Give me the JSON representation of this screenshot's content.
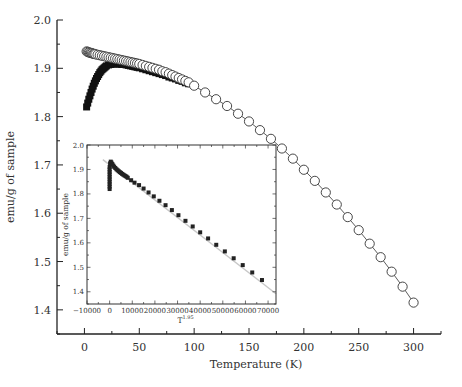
{
  "chart_data": [
    {
      "id": "main",
      "type": "scatter",
      "title": "",
      "xlabel": "Temperature (K)",
      "ylabel": "emu/g of sample",
      "xlim": [
        -25,
        325
      ],
      "ylim": [
        1.35,
        2.0
      ],
      "xticks": [
        0,
        50,
        100,
        150,
        200,
        250,
        300
      ],
      "yticks": [
        1.4,
        1.5,
        1.6,
        1.7,
        1.8,
        1.9,
        2.0
      ],
      "ytick_labels": [
        "1.4",
        "1.5",
        "1.6",
        "1.7",
        "1.8",
        "1.9",
        "2.0"
      ],
      "grid": false,
      "legend": null,
      "series": [
        {
          "name": "open-circles (FC)",
          "marker": "open-circle",
          "line": true,
          "x": [
            2,
            3,
            4,
            5,
            6,
            7,
            8,
            9,
            10,
            12,
            14,
            16,
            18,
            20,
            22,
            24,
            26,
            28,
            30,
            32,
            34,
            36,
            38,
            40,
            42,
            44,
            46,
            48,
            50,
            53,
            56,
            59,
            62,
            65,
            68,
            71,
            74,
            77,
            80,
            83,
            86,
            89,
            92,
            95,
            100,
            110,
            120,
            130,
            140,
            150,
            160,
            170,
            180,
            190,
            200,
            210,
            220,
            230,
            240,
            250,
            260,
            270,
            280,
            290,
            300
          ],
          "y": [
            1.935,
            1.934,
            1.933,
            1.932,
            1.932,
            1.931,
            1.93,
            1.93,
            1.929,
            1.928,
            1.927,
            1.926,
            1.925,
            1.924,
            1.923,
            1.922,
            1.921,
            1.92,
            1.919,
            1.918,
            1.917,
            1.916,
            1.915,
            1.914,
            1.913,
            1.912,
            1.911,
            1.91,
            1.909,
            1.907,
            1.905,
            1.903,
            1.901,
            1.899,
            1.897,
            1.894,
            1.892,
            1.889,
            1.886,
            1.883,
            1.88,
            1.877,
            1.874,
            1.871,
            1.864,
            1.85,
            1.836,
            1.822,
            1.806,
            1.79,
            1.772,
            1.754,
            1.734,
            1.713,
            1.69,
            1.667,
            1.643,
            1.618,
            1.592,
            1.565,
            1.537,
            1.509,
            1.479,
            1.448,
            1.415
          ]
        },
        {
          "name": "filled-squares (ZFC)",
          "marker": "filled-square",
          "line": false,
          "x": [
            2,
            3,
            4,
            5,
            6,
            7,
            8,
            9,
            10,
            11,
            12,
            13,
            14,
            15,
            16,
            17,
            18,
            19,
            20,
            22,
            24,
            26,
            28,
            30,
            32,
            34,
            36,
            38,
            40,
            42,
            44,
            46,
            48,
            50,
            53,
            56,
            59,
            62,
            65,
            68,
            71,
            74,
            77,
            80,
            83,
            86,
            89,
            92,
            95
          ],
          "y": [
            1.82,
            1.828,
            1.836,
            1.843,
            1.85,
            1.857,
            1.863,
            1.869,
            1.874,
            1.879,
            1.883,
            1.887,
            1.891,
            1.894,
            1.897,
            1.899,
            1.901,
            1.903,
            1.905,
            1.907,
            1.908,
            1.909,
            1.909,
            1.909,
            1.909,
            1.908,
            1.908,
            1.907,
            1.906,
            1.905,
            1.904,
            1.903,
            1.902,
            1.901,
            1.899,
            1.897,
            1.895,
            1.893,
            1.891,
            1.889,
            1.887,
            1.885,
            1.882,
            1.88,
            1.878,
            1.875,
            1.873,
            1.87,
            1.868
          ]
        }
      ]
    },
    {
      "id": "inset",
      "type": "scatter",
      "title": "",
      "xlabel": "T^1.95",
      "xlabel_base": "T",
      "xlabel_exp": "1.95",
      "ylabel": "emu/g of sample",
      "xlim": [
        -10000,
        73500
      ],
      "ylim": [
        1.35,
        2.0
      ],
      "xticks": [
        -10000,
        0,
        10000,
        20000,
        30000,
        40000,
        50000,
        60000,
        70000
      ],
      "xtick_labels": [
        "−10000",
        "0",
        "10000",
        "20000",
        "30000",
        "40000",
        "50000",
        "60000",
        "70000"
      ],
      "yticks": [
        1.4,
        1.5,
        1.6,
        1.7,
        1.8,
        1.9,
        2.0
      ],
      "ytick_labels": [
        "1.4",
        "1.5",
        "1.6",
        "1.7",
        "1.8",
        "1.9",
        "2.0"
      ],
      "grid": false,
      "legend": null,
      "fit_line": {
        "x": [
          -3000,
          73500
        ],
        "y": [
          1.94,
          1.392
        ],
        "color": "#c8c8c8"
      },
      "series": [
        {
          "name": "filled-squares",
          "marker": "filled-square",
          "x": [
            0,
            0,
            0,
            0,
            0,
            0,
            0,
            0,
            0,
            0,
            200,
            500,
            800,
            1200,
            1600,
            2000,
            2500,
            3000,
            3500,
            4000,
            4500,
            5000,
            5500,
            6000,
            6500,
            7000,
            7500,
            8000,
            9500,
            11000,
            13000,
            15000,
            17200,
            19500,
            22000,
            24700,
            27500,
            30400,
            33500,
            36700,
            40000,
            43500,
            47100,
            50900,
            54800,
            58800,
            63000,
            67300
          ],
          "y": [
            1.82,
            1.83,
            1.84,
            1.85,
            1.86,
            1.87,
            1.88,
            1.89,
            1.9,
            1.91,
            1.925,
            1.932,
            1.928,
            1.922,
            1.916,
            1.911,
            1.906,
            1.901,
            1.897,
            1.893,
            1.889,
            1.886,
            1.882,
            1.879,
            1.876,
            1.873,
            1.87,
            1.866,
            1.856,
            1.846,
            1.836,
            1.822,
            1.806,
            1.79,
            1.772,
            1.754,
            1.734,
            1.713,
            1.69,
            1.667,
            1.643,
            1.618,
            1.592,
            1.565,
            1.537,
            1.509,
            1.479,
            1.448
          ]
        }
      ]
    }
  ],
  "layout": {
    "main_plot_px": {
      "x0": 57,
      "x1": 441,
      "y_top": 20,
      "y_bottom": 334
    },
    "inset_px": {
      "left": 87,
      "top": 145,
      "right": 276,
      "bottom": 304
    }
  }
}
